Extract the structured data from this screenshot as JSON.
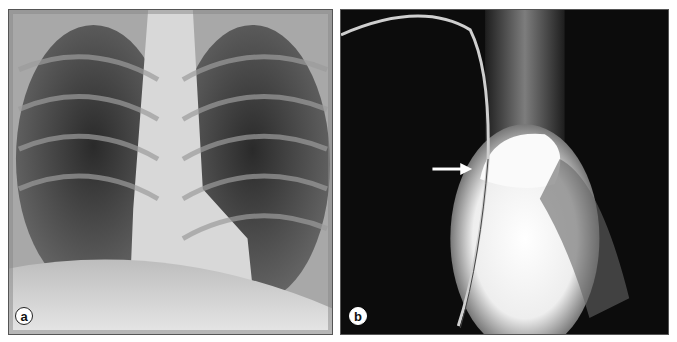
{
  "figure": {
    "panels": [
      {
        "label": "a",
        "description": "Frontal chest radiograph"
      },
      {
        "label": "b",
        "description": "Angiographic chest radiograph with catheter; arrow indicating contrast-filled vessel"
      }
    ],
    "annotations": [
      {
        "panel": "b",
        "type": "arrow",
        "direction": "right"
      }
    ]
  }
}
